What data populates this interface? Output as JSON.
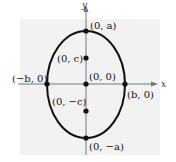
{
  "diagram": {
    "type": "ellipse-vertical-major-axis",
    "axes": {
      "x_label": "x",
      "y_label": "y"
    },
    "colors": {
      "background_panel": "#f2f2f2",
      "curve": "#111111",
      "axis": "#777777",
      "point": "#111111"
    },
    "points": [
      {
        "id": "top-vertex",
        "label": "(0, a)",
        "cx": 86,
        "cy": 31
      },
      {
        "id": "focus-upper",
        "label": "(0, c)",
        "cx": 86,
        "cy": 58
      },
      {
        "id": "center",
        "label": "(0, 0)",
        "cx": 86,
        "cy": 84
      },
      {
        "id": "left-covertex",
        "label": "(−b, 0)",
        "cx": 47,
        "cy": 84
      },
      {
        "id": "right-covertex",
        "label": "(b, 0)",
        "cx": 125,
        "cy": 84
      },
      {
        "id": "focus-lower",
        "label": "(0, −c)",
        "cx": 86,
        "cy": 111
      },
      {
        "id": "bottom-vertex",
        "label": "(0, −a)",
        "cx": 86,
        "cy": 138
      }
    ]
  }
}
